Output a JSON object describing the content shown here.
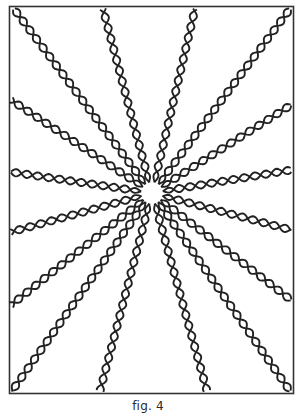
{
  "figure": {
    "caption": "fig. 4",
    "strand_count": 16,
    "ink_color": "#222222",
    "background_color": "#ffffff"
  }
}
